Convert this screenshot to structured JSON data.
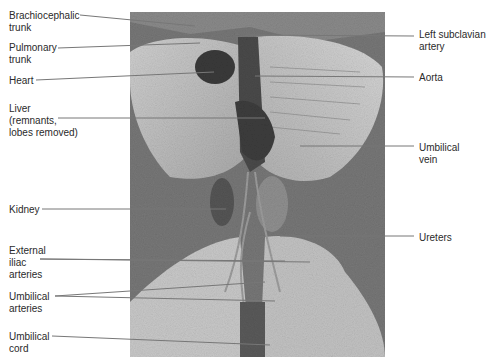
{
  "figure": {
    "left_labels": [
      {
        "id": "brachiocephalic-trunk",
        "text": "Brachiocephalic\ntrunk",
        "x": 9,
        "y": 10
      },
      {
        "id": "pulmonary-trunk",
        "text": "Pulmonary\ntrunk",
        "x": 9,
        "y": 42
      },
      {
        "id": "heart",
        "text": "Heart",
        "x": 9,
        "y": 75
      },
      {
        "id": "liver",
        "text": "Liver\n(remnants,\nlobes removed)",
        "x": 9,
        "y": 103
      },
      {
        "id": "kidney",
        "text": "Kidney",
        "x": 9,
        "y": 204
      },
      {
        "id": "external-iliac-arteries",
        "text": "External\niliac\narteries",
        "x": 9,
        "y": 245
      },
      {
        "id": "umbilical-arteries",
        "text": "Umbilical\narteries",
        "x": 9,
        "y": 291
      },
      {
        "id": "umbilical-cord",
        "text": "Umbilical\ncord",
        "x": 9,
        "y": 331
      }
    ],
    "right_labels": [
      {
        "id": "left-subclavian-artery",
        "text": "Left subclavian\nartery",
        "x": 419,
        "y": 29
      },
      {
        "id": "aorta",
        "text": "Aorta",
        "x": 419,
        "y": 72
      },
      {
        "id": "umbilical-vein",
        "text": "Umbilical\nvein",
        "x": 419,
        "y": 142
      },
      {
        "id": "ureters",
        "text": "Ureters",
        "x": 419,
        "y": 232
      }
    ],
    "colors": {
      "text": "#2a2a2a",
      "leader_line": "#777777",
      "background": "#ffffff",
      "specimen_bg": "#6b6b6b"
    }
  }
}
